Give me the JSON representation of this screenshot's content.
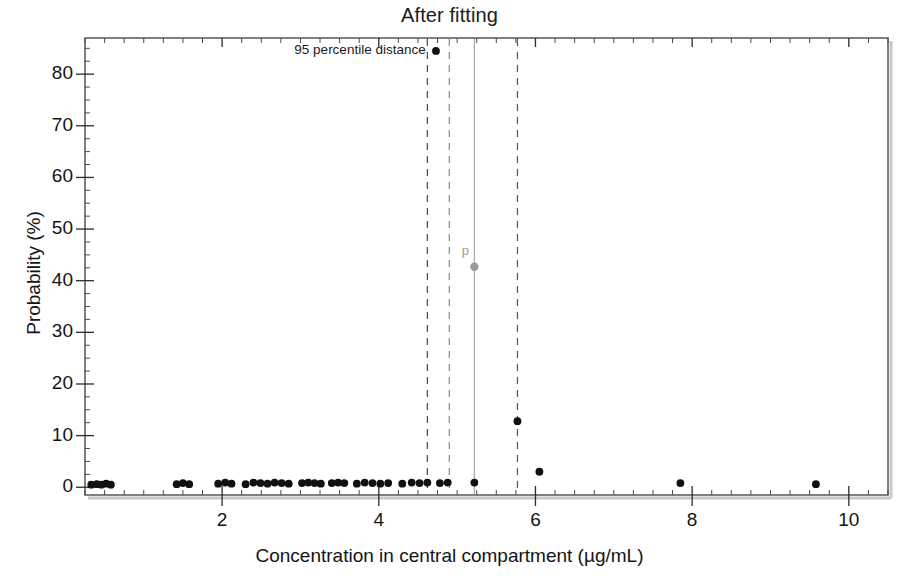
{
  "chart_data": {
    "type": "scatter",
    "title": "After fitting",
    "xlabel": "Concentration in central compartment (µg/mL)",
    "ylabel": "Probability (%)",
    "xlim": [
      0.25,
      10.5
    ],
    "ylim": [
      -1.5,
      87
    ],
    "xticks": [
      2,
      4,
      6,
      8,
      10
    ],
    "xtick_labels": [
      "2",
      "4",
      "6",
      "8",
      "10"
    ],
    "yticks": [
      0,
      10,
      20,
      30,
      40,
      50,
      60,
      70,
      80
    ],
    "ytick_labels": [
      "0",
      "10",
      "20",
      "30",
      "40",
      "50",
      "60",
      "70",
      "80"
    ],
    "x_minor_tick_step": 0.25,
    "y_minor_tick_step": 2.5,
    "grid": false,
    "legend": null,
    "series": [
      {
        "name": "probability",
        "color": "#111111",
        "marker": "circle",
        "points": [
          [
            0.33,
            0.5
          ],
          [
            0.4,
            0.6
          ],
          [
            0.46,
            0.5
          ],
          [
            0.52,
            0.7
          ],
          [
            0.58,
            0.5
          ],
          [
            1.42,
            0.6
          ],
          [
            1.5,
            0.8
          ],
          [
            1.58,
            0.6
          ],
          [
            1.95,
            0.7
          ],
          [
            2.04,
            0.9
          ],
          [
            2.12,
            0.7
          ],
          [
            2.3,
            0.6
          ],
          [
            2.4,
            0.9
          ],
          [
            2.49,
            0.8
          ],
          [
            2.58,
            0.7
          ],
          [
            2.67,
            0.9
          ],
          [
            2.76,
            0.8
          ],
          [
            2.85,
            0.7
          ],
          [
            3.02,
            0.8
          ],
          [
            3.1,
            0.9
          ],
          [
            3.18,
            0.8
          ],
          [
            3.26,
            0.7
          ],
          [
            3.4,
            0.8
          ],
          [
            3.48,
            0.9
          ],
          [
            3.56,
            0.8
          ],
          [
            3.72,
            0.7
          ],
          [
            3.82,
            0.9
          ],
          [
            3.92,
            0.8
          ],
          [
            4.02,
            0.7
          ],
          [
            4.12,
            0.8
          ],
          [
            4.3,
            0.7
          ],
          [
            4.42,
            0.9
          ],
          [
            4.52,
            0.8
          ],
          [
            4.62,
            0.9
          ],
          [
            4.78,
            0.8
          ],
          [
            4.88,
            0.9
          ],
          [
            5.22,
            0.9
          ],
          [
            5.77,
            12.8
          ],
          [
            6.05,
            3.0
          ],
          [
            7.85,
            0.8
          ],
          [
            9.58,
            0.6
          ],
          [
            4.73,
            84.5
          ]
        ]
      },
      {
        "name": "p-marker",
        "color": "#9a9a9a",
        "marker": "circle",
        "points": [
          [
            5.22,
            42.7
          ]
        ]
      }
    ],
    "annotations": [
      {
        "name": "percentile-label",
        "text": "95 percentile distance",
        "x": 4.62,
        "y": 84.5,
        "align": "right",
        "color": "#1b1b1b"
      },
      {
        "name": "p-label",
        "text": "p",
        "x": 5.02,
        "y": 45.5,
        "align": "left",
        "color": "#9a9a9a"
      }
    ],
    "vlines": [
      {
        "name": "dashed-line-1",
        "x": 4.62,
        "style": "dashed",
        "color": "#4a4a4a"
      },
      {
        "name": "dashed-line-2",
        "x": 4.9,
        "style": "dashed",
        "color": "#8a8a8a"
      },
      {
        "name": "solid-line-p",
        "x": 5.22,
        "style": "solid",
        "color": "#9f9f9f"
      },
      {
        "name": "dashed-line-3",
        "x": 5.77,
        "style": "dashed",
        "color": "#555555"
      }
    ]
  }
}
